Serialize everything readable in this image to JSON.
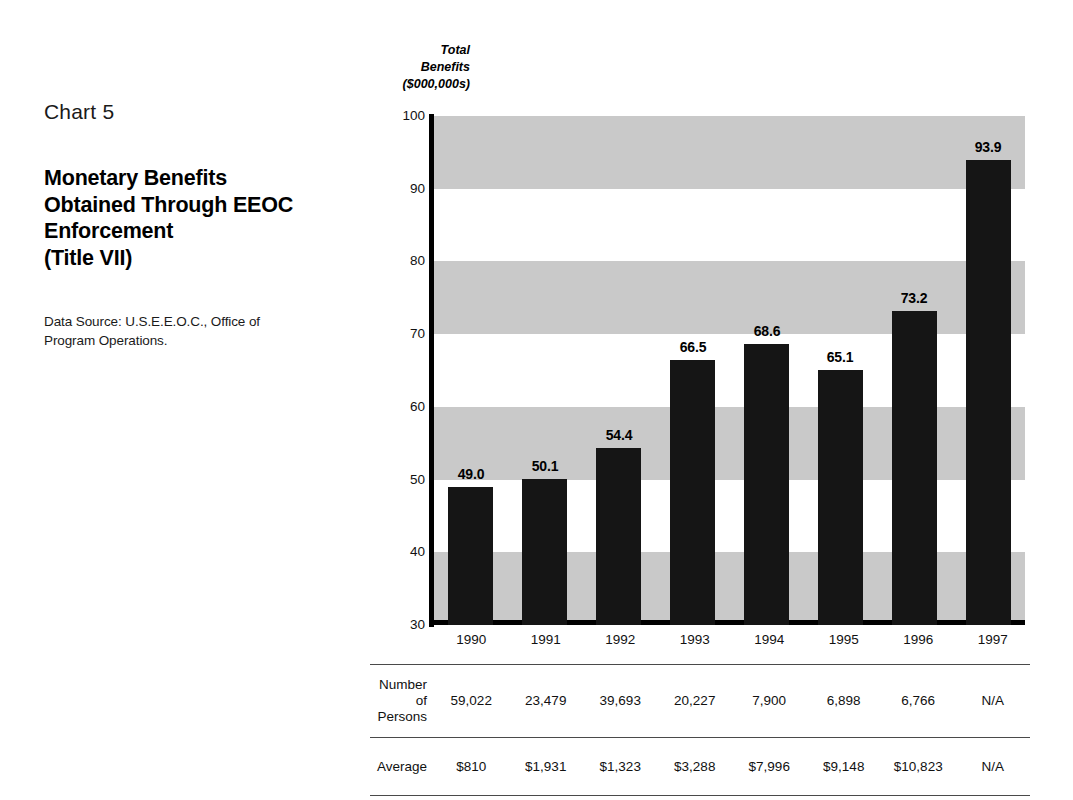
{
  "caption": {
    "chart_number": "Chart 5",
    "title_lines": [
      "Monetary Benefits",
      "Obtained Through EEOC",
      "Enforcement",
      "(Title VII)"
    ],
    "source_lines": [
      "Data Source: U.S.E.E.O.C., Office of",
      "Program Operations."
    ]
  },
  "axis": {
    "y_title_lines": [
      "Total",
      "Benefits",
      "($000,000s)"
    ],
    "y_ticks": [
      "100",
      "90",
      "80",
      "70",
      "60",
      "50",
      "40",
      "30"
    ]
  },
  "table": {
    "row_labels": {
      "persons_line1": "Number of",
      "persons_line2": "Persons",
      "average": "Average"
    },
    "years": [
      "1990",
      "1991",
      "1992",
      "1993",
      "1994",
      "1995",
      "1996",
      "1997"
    ],
    "persons": [
      "59,022",
      "23,479",
      "39,693",
      "20,227",
      "7,900",
      "6,898",
      "6,766",
      "N/A"
    ],
    "average": [
      "$810",
      "$1,931",
      "$1,323",
      "$3,288",
      "$7,996",
      "$9,148",
      "$10,823",
      "N/A"
    ]
  },
  "colors": {
    "bar": "#151515",
    "band": "#c9c9c9",
    "axis": "#000000",
    "rule": "#4a4a4a"
  },
  "chart_data": {
    "type": "bar",
    "title": "Monetary Benefits Obtained Through EEOC Enforcement (Title VII)",
    "subtitle": "Chart 5",
    "xlabel": "",
    "ylabel": "Total Benefits ($000,000s)",
    "ylim": [
      30,
      100
    ],
    "ytick_step": 10,
    "grid": "alternating horizontal bands every 10 units",
    "legend": "none",
    "categories": [
      "1990",
      "1991",
      "1992",
      "1993",
      "1994",
      "1995",
      "1996",
      "1997"
    ],
    "values": [
      49.0,
      50.1,
      54.4,
      66.5,
      68.6,
      65.1,
      73.2,
      93.9
    ],
    "data_labels": [
      "49.0",
      "50.1",
      "54.4",
      "66.5",
      "68.6",
      "65.1",
      "73.2",
      "93.9"
    ],
    "annotations": {
      "number_of_persons": [
        59022,
        23479,
        39693,
        20227,
        7900,
        6898,
        6766,
        null
      ],
      "average": [
        810,
        1931,
        1323,
        3288,
        7996,
        9148,
        10823,
        null
      ]
    },
    "source": "U.S.E.E.O.C., Office of Program Operations."
  }
}
